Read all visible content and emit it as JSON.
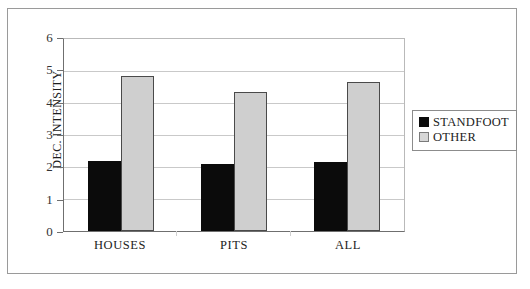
{
  "chart_data": {
    "type": "bar",
    "title": "",
    "subtitle": "",
    "xlabel": "",
    "ylabel": "DEC. INTENSITY",
    "categories": [
      "HOUSES",
      "PITS",
      "ALL"
    ],
    "series": [
      {
        "name": "STANDFOOT",
        "color": "#0b0b0b",
        "values": [
          2.2,
          2.1,
          2.15
        ]
      },
      {
        "name": "OTHER",
        "color": "#cfcfcf",
        "values": [
          4.85,
          4.35,
          4.67
        ]
      }
    ],
    "ylim": [
      0,
      6
    ],
    "ytick_step": 1,
    "yticks": [
      "6",
      "5",
      "4",
      "3",
      "2",
      "1",
      "0"
    ],
    "grid": true,
    "legend_position": "right",
    "annotations": []
  },
  "legend": {
    "entries": [
      {
        "label": "STANDFOOT",
        "swatch": "black-square-icon"
      },
      {
        "label": "OTHER",
        "swatch": "gray-square-icon"
      }
    ]
  },
  "colors": {
    "standfoot": "#0b0b0b",
    "other": "#cfcfcf",
    "other_border": "#4a4a4a",
    "grid": "#c9c9c9",
    "axis": "#6f6f6f",
    "frame": "#9a9a9a",
    "background": "#ffffff"
  }
}
